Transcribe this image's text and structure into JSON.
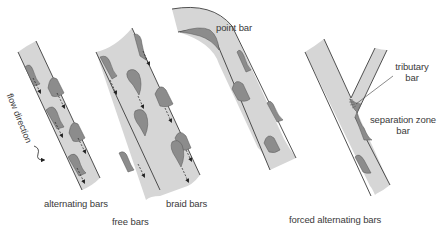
{
  "diagram": {
    "colors": {
      "channel_fill": "#d6d6d6",
      "bar_fill": "#8c8c8c",
      "outline": "#3c3c3c",
      "text": "#3a3a3a"
    },
    "labels": {
      "flow_direction": "flow direction",
      "alternating_bars": "alternating bars",
      "braid_bars": "braid bars",
      "free_bars": "free bars",
      "point_bar": "point bar",
      "tributary_bar_line1": "tributary",
      "tributary_bar_line2": "bar",
      "separation_zone_bar_line1": "separation zone",
      "separation_zone_bar_line2": "bar",
      "forced_alternating_bars": "forced alternating bars"
    },
    "groups": [
      {
        "name": "free bars",
        "members": [
          "alternating bars",
          "braid bars"
        ]
      },
      {
        "name": "forced alternating bars",
        "members": [
          "point bar",
          "tributary bar",
          "separation zone bar"
        ]
      }
    ],
    "icons": [
      "flow-arrow-icon",
      "dashed-flow-arrow-icon"
    ]
  }
}
